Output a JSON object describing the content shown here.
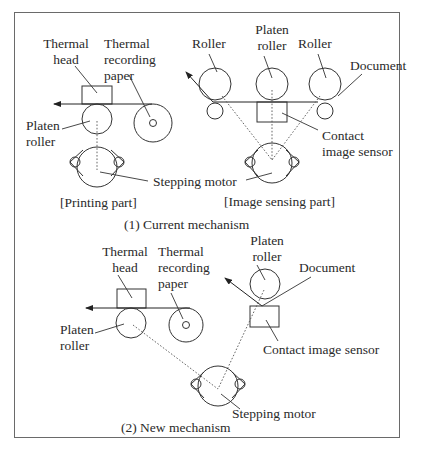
{
  "diagram": {
    "sections": [
      {
        "caption": "(1) Current mechanism",
        "printing_part": {
          "caption": "[Printing part]",
          "labels": {
            "thermal_head": [
              "Thermal",
              "head"
            ],
            "thermal_recording_paper": [
              "Thermal",
              "recording",
              "paper"
            ],
            "platen_roller": [
              "Platen",
              "roller"
            ]
          }
        },
        "image_sensing_part": {
          "caption": "[Image sensing part]",
          "labels": {
            "roller_left": "Roller",
            "platen_roller": [
              "Platen",
              "roller"
            ],
            "roller_right": "Roller",
            "document": "Document",
            "contact_image_sensor": [
              "Contact",
              "image sensor"
            ]
          }
        },
        "stepping_motor": "Stepping motor"
      },
      {
        "caption": "(2) New mechanism",
        "labels": {
          "thermal_head": [
            "Thermal",
            "head"
          ],
          "thermal_recording_paper": [
            "Thermal",
            "recording",
            "paper"
          ],
          "platen_roller_print": [
            "Platen",
            "roller"
          ],
          "platen_roller_sensor": [
            "Platen",
            "roller"
          ],
          "document": "Document",
          "contact_image_sensor": "Contact image sensor",
          "stepping_motor": "Stepping motor"
        }
      }
    ]
  }
}
